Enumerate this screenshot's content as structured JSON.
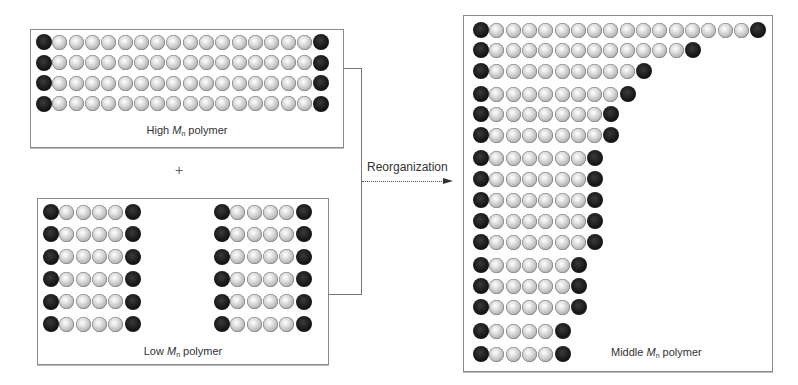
{
  "diagram": {
    "high_mn": {
      "label_prefix": "High ",
      "label_symbol": "M",
      "label_subscript": "n",
      "label_suffix": " polymer",
      "chains": [
        16,
        16,
        16,
        16
      ]
    },
    "plus_sign": "+",
    "low_mn": {
      "label_prefix": "Low ",
      "label_symbol": "M",
      "label_subscript": "n",
      "label_suffix": " polymer",
      "columns": 2,
      "chains_per_column": [
        4,
        4,
        4,
        4,
        4,
        4
      ]
    },
    "arrow": {
      "label": "Reorganization",
      "style": "dotted"
    },
    "middle_mn": {
      "label_prefix": "Middle ",
      "label_symbol": "M",
      "label_subscript": "n",
      "label_suffix": " polymer",
      "chains": [
        16,
        12,
        9,
        8,
        7,
        7,
        6,
        6,
        6,
        6,
        6,
        5,
        5,
        5,
        4,
        4
      ]
    },
    "legend_note": {
      "end_group": "black bead",
      "repeat_unit": "gray bead"
    },
    "colors": {
      "end_group": "#141414",
      "repeat_unit": "#c8c8c8",
      "border": "#8a8a8a"
    }
  }
}
